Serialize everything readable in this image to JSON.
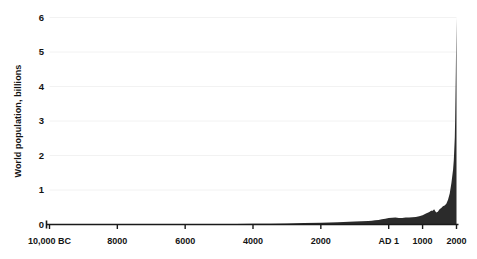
{
  "chart_data": {
    "type": "area",
    "title": "",
    "xlabel": "",
    "ylabel": "World population, billions",
    "ylim": [
      0,
      6
    ],
    "xlim": [
      -10000,
      2000
    ],
    "grid": true,
    "legend": false,
    "legend_position": "none",
    "fill_color": "#2b2b2b",
    "axis_color": "#1a1a1a",
    "grid_color": "#f2f2f2",
    "yticks": [
      {
        "value": 6,
        "label": "6"
      },
      {
        "value": 5,
        "label": "5"
      },
      {
        "value": 4,
        "label": "4"
      },
      {
        "value": 3,
        "label": "3"
      },
      {
        "value": 2,
        "label": "2"
      },
      {
        "value": 1,
        "label": "1"
      },
      {
        "value": 0,
        "label": "0"
      }
    ],
    "xticks": [
      {
        "value": -10000,
        "label": "10,000 BC"
      },
      {
        "value": -8000,
        "label": "8000"
      },
      {
        "value": -6000,
        "label": "6000"
      },
      {
        "value": -4000,
        "label": "4000"
      },
      {
        "value": -2000,
        "label": "2000"
      },
      {
        "value": 1,
        "label": "AD 1"
      },
      {
        "value": 1000,
        "label": "1000"
      },
      {
        "value": 2000,
        "label": "2000"
      }
    ],
    "x": [
      -10000,
      -9500,
      -9000,
      -8500,
      -8000,
      -7500,
      -7000,
      -6500,
      -6000,
      -5500,
      -5000,
      -4500,
      -4000,
      -3500,
      -3000,
      -2500,
      -2000,
      -1500,
      -1000,
      -800,
      -600,
      -500,
      -400,
      -300,
      -200,
      -100,
      1,
      100,
      200,
      300,
      400,
      500,
      600,
      700,
      800,
      900,
      1000,
      1100,
      1200,
      1250,
      1300,
      1340,
      1400,
      1450,
      1500,
      1550,
      1600,
      1650,
      1700,
      1750,
      1800,
      1850,
      1900,
      1920,
      1940,
      1950,
      1960,
      1970,
      1980,
      1990,
      2000
    ],
    "values": [
      0.004,
      0.004,
      0.005,
      0.005,
      0.005,
      0.006,
      0.007,
      0.008,
      0.009,
      0.011,
      0.013,
      0.016,
      0.02,
      0.025,
      0.03,
      0.04,
      0.05,
      0.065,
      0.085,
      0.095,
      0.105,
      0.11,
      0.12,
      0.13,
      0.15,
      0.17,
      0.19,
      0.195,
      0.2,
      0.19,
      0.19,
      0.2,
      0.2,
      0.21,
      0.22,
      0.24,
      0.265,
      0.32,
      0.36,
      0.4,
      0.395,
      0.44,
      0.35,
      0.37,
      0.44,
      0.48,
      0.53,
      0.55,
      0.6,
      0.72,
      0.9,
      1.2,
      1.6,
      1.86,
      2.3,
      2.52,
      3.02,
      3.7,
      4.43,
      5.27,
      6.0
    ],
    "units": "billions"
  }
}
